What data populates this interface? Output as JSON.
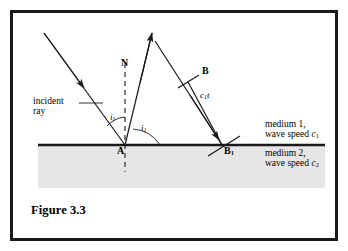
{
  "figure": {
    "caption": "Figure 3.3",
    "border_color": "#1a1a1a",
    "background_color": "#ffffff",
    "line_color": "#1a1a1a",
    "medium2_fill": "#e4e4e4"
  },
  "points": {
    "normal_top": "N",
    "incidence_point": "A",
    "wavefront_top": "B",
    "wavefront_base": "B",
    "wavefront_base_sub": "1"
  },
  "angles": {
    "incident": "i",
    "incident_sub": "1",
    "reflected": "i",
    "reflected_sub": "1"
  },
  "labels": {
    "incident_ray_line1": "incident",
    "incident_ray_line2": "ray",
    "path_length": "c",
    "path_length_sub": "1",
    "path_length_tail": "t"
  },
  "media": {
    "upper_line1": "medium 1,",
    "upper_line2_prefix": "wave speed ",
    "upper_line2_symbol": "c",
    "upper_line2_sub": "1",
    "lower_line1": "medium 2,",
    "lower_line2_prefix": "wave speed ",
    "lower_line2_symbol": "c",
    "lower_line2_sub": "2"
  }
}
